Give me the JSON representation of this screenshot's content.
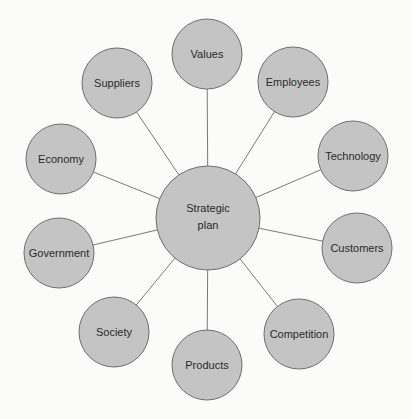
{
  "diagram": {
    "type": "hub-and-spoke",
    "center": {
      "id": "strategic-plan",
      "label_lines": [
        "Strategic",
        "plan"
      ]
    },
    "nodes": [
      {
        "id": "values",
        "label": "Values"
      },
      {
        "id": "employees",
        "label": "Employees"
      },
      {
        "id": "technology",
        "label": "Technology"
      },
      {
        "id": "customers",
        "label": "Customers"
      },
      {
        "id": "competition",
        "label": "Competition"
      },
      {
        "id": "products",
        "label": "Products"
      },
      {
        "id": "society",
        "label": "Society"
      },
      {
        "id": "government",
        "label": "Government"
      },
      {
        "id": "economy",
        "label": "Economy"
      },
      {
        "id": "suppliers",
        "label": "Suppliers"
      }
    ],
    "colors": {
      "fill": "#c4c4c4",
      "stroke": "#6e6e6e",
      "edge": "#7a7a7a",
      "text": "#2a2a2a",
      "background": "#fbfbfa"
    }
  }
}
